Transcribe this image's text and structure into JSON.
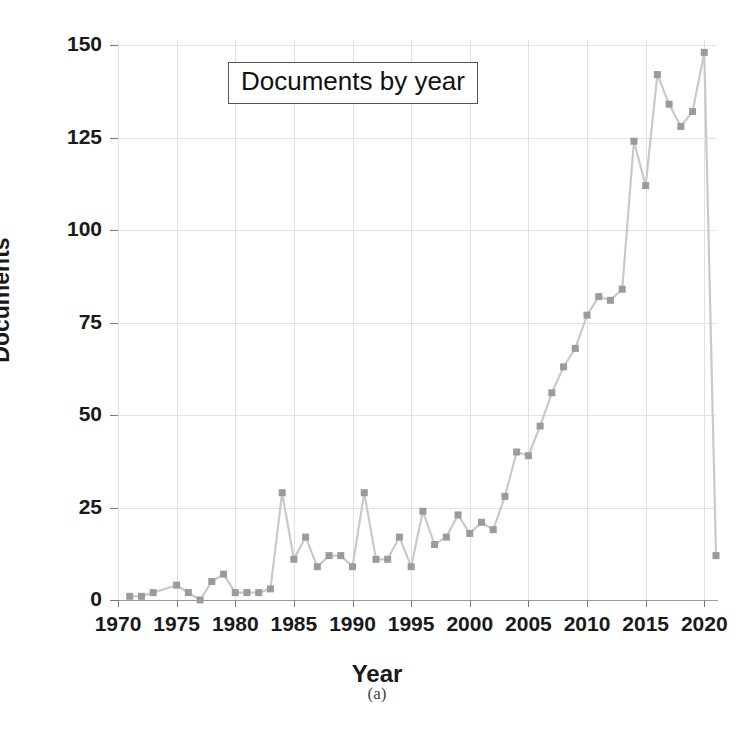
{
  "caption": "(a)",
  "chart_data": {
    "type": "line",
    "title": "Documents by year",
    "xlabel": "Year",
    "ylabel": "Documents",
    "xlim": [
      1970,
      2021
    ],
    "ylim": [
      0,
      150
    ],
    "grid": true,
    "legend": "none",
    "marker": "square",
    "line_color": "#c9c9c9",
    "marker_color": "#9b9b9b",
    "xticks": [
      1970,
      1975,
      1980,
      1985,
      1990,
      1995,
      2000,
      2005,
      2010,
      2015,
      2020
    ],
    "yticks": [
      0,
      25,
      50,
      75,
      100,
      125,
      150
    ],
    "x": [
      1971,
      1972,
      1973,
      1975,
      1976,
      1977,
      1978,
      1979,
      1980,
      1981,
      1982,
      1983,
      1984,
      1985,
      1986,
      1987,
      1988,
      1989,
      1990,
      1991,
      1992,
      1993,
      1994,
      1995,
      1996,
      1997,
      1998,
      1999,
      2000,
      2001,
      2002,
      2003,
      2004,
      2005,
      2006,
      2007,
      2008,
      2009,
      2010,
      2011,
      2012,
      2013,
      2014,
      2015,
      2016,
      2017,
      2018,
      2019,
      2020,
      2021
    ],
    "values": [
      1,
      1,
      2,
      4,
      2,
      0,
      5,
      7,
      2,
      2,
      2,
      3,
      29,
      11,
      17,
      9,
      12,
      12,
      9,
      29,
      11,
      11,
      17,
      9,
      24,
      15,
      17,
      23,
      18,
      21,
      19,
      28,
      40,
      39,
      47,
      56,
      63,
      68,
      77,
      82,
      81,
      84,
      124,
      112,
      142,
      134,
      128,
      132,
      148,
      12
    ],
    "series": [
      {
        "name": "Documents",
        "values": [
          1,
          1,
          2,
          4,
          2,
          0,
          5,
          7,
          2,
          2,
          2,
          3,
          29,
          11,
          17,
          9,
          12,
          12,
          9,
          29,
          11,
          11,
          17,
          9,
          24,
          15,
          17,
          23,
          18,
          21,
          19,
          28,
          40,
          39,
          47,
          56,
          63,
          68,
          77,
          82,
          81,
          84,
          124,
          112,
          142,
          134,
          128,
          132,
          148,
          12
        ]
      }
    ]
  }
}
